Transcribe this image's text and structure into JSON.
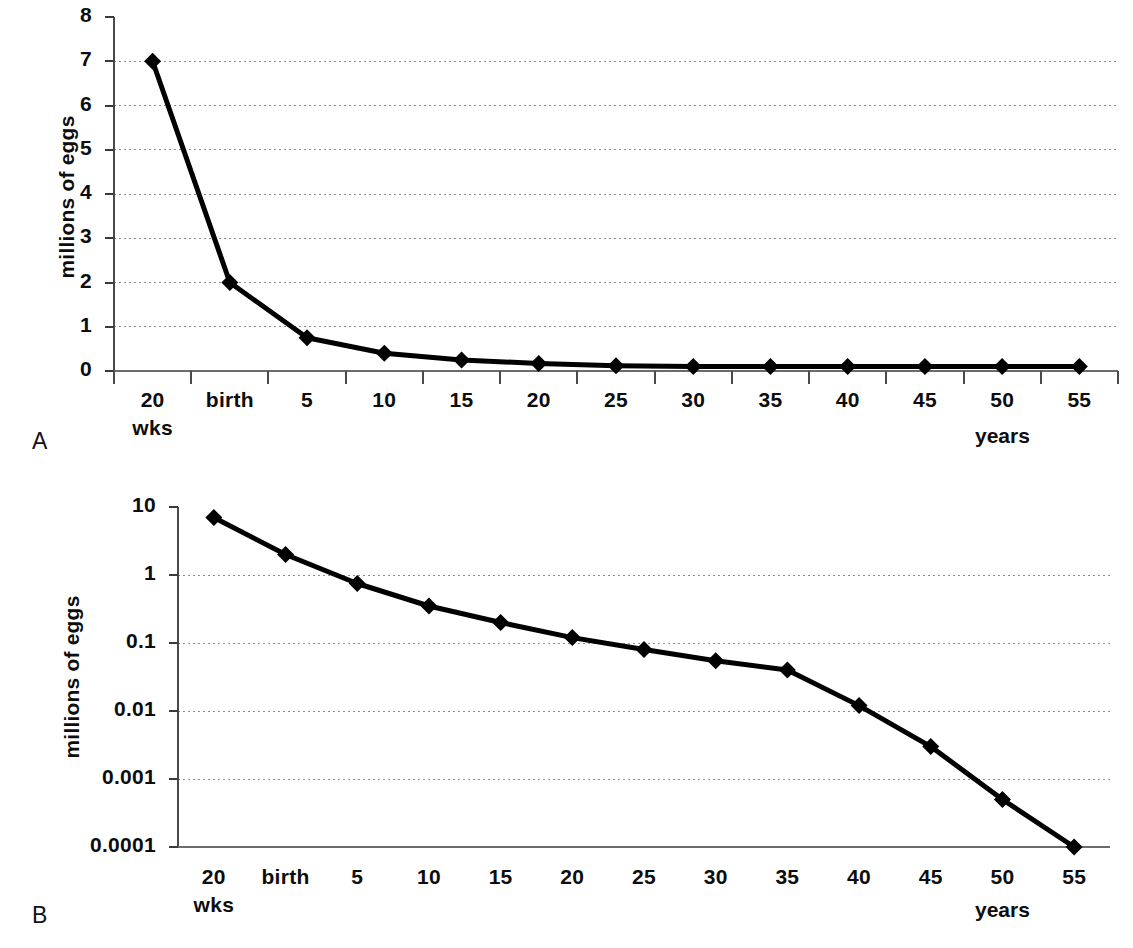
{
  "figure": {
    "panel_a_letter": "A",
    "panel_b_letter": "B"
  },
  "chart_data": [
    {
      "id": "panel-a",
      "type": "line",
      "title": "",
      "panel_label": "A",
      "xlabel": "",
      "ylabel": "millions of eggs",
      "x_unit_label": "years",
      "categories": [
        "20 wks",
        "birth",
        "5",
        "10",
        "15",
        "20",
        "25",
        "30",
        "35",
        "40",
        "45",
        "50",
        "55"
      ],
      "category_lines": [
        [
          "20",
          "wks"
        ],
        [
          "birth",
          ""
        ],
        [
          "5",
          ""
        ],
        [
          "10",
          ""
        ],
        [
          "15",
          ""
        ],
        [
          "20",
          ""
        ],
        [
          "25",
          ""
        ],
        [
          "30",
          ""
        ],
        [
          "35",
          ""
        ],
        [
          "40",
          ""
        ],
        [
          "45",
          ""
        ],
        [
          "50",
          ""
        ],
        [
          "55",
          ""
        ]
      ],
      "values": [
        7,
        2,
        0.75,
        0.4,
        0.25,
        0.17,
        0.12,
        0.1,
        0.1,
        0.1,
        0.1,
        0.1,
        0.1
      ],
      "y_scale": "linear",
      "ylim": [
        0,
        8
      ],
      "ytick_labels": [
        "0",
        "1",
        "2",
        "3",
        "4",
        "5",
        "6",
        "7",
        "8"
      ],
      "yticks": [
        0,
        1,
        2,
        3,
        4,
        5,
        6,
        7,
        8
      ],
      "grid": true,
      "grid_style": "dotted-horizontal",
      "legend": "none",
      "marker": "diamond",
      "line_color": "#000000"
    },
    {
      "id": "panel-b",
      "type": "line",
      "title": "",
      "panel_label": "B",
      "xlabel": "",
      "ylabel": "millions of eggs",
      "x_unit_label": "years",
      "categories": [
        "20 wks",
        "birth",
        "5",
        "10",
        "15",
        "20",
        "25",
        "30",
        "35",
        "40",
        "45",
        "50",
        "55"
      ],
      "category_lines": [
        [
          "20",
          "wks"
        ],
        [
          "birth",
          ""
        ],
        [
          "5",
          ""
        ],
        [
          "10",
          ""
        ],
        [
          "15",
          ""
        ],
        [
          "20",
          ""
        ],
        [
          "25",
          ""
        ],
        [
          "30",
          ""
        ],
        [
          "35",
          ""
        ],
        [
          "40",
          ""
        ],
        [
          "45",
          ""
        ],
        [
          "50",
          ""
        ],
        [
          "55",
          ""
        ]
      ],
      "values": [
        7,
        2,
        0.75,
        0.35,
        0.2,
        0.12,
        0.08,
        0.055,
        0.04,
        0.012,
        0.003,
        0.0005,
        0.0001
      ],
      "y_scale": "log10",
      "ylim": [
        0.0001,
        10
      ],
      "ytick_labels": [
        "0.0001",
        "0.001",
        "0.01",
        "0.1",
        "1",
        "10"
      ],
      "yticks": [
        0.0001,
        0.001,
        0.01,
        0.1,
        1,
        10
      ],
      "grid": true,
      "grid_style": "dotted-horizontal",
      "legend": "none",
      "marker": "diamond",
      "line_color": "#000000"
    }
  ]
}
